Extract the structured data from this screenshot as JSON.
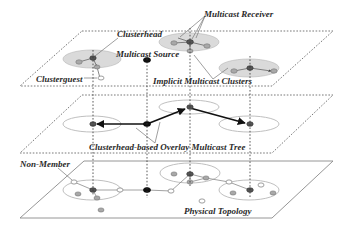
{
  "diagram": {
    "layers": [
      {
        "id": "top",
        "name": "Implicit Multicast Clusters layer"
      },
      {
        "id": "middle",
        "name": "Clusterhead-based Overlay Multicast Tree layer"
      },
      {
        "id": "bottom",
        "name": "Physical Topology layer"
      }
    ],
    "labels": {
      "clusterhead": "Clusterhead",
      "multicast_receiver": "Multicast Receiver",
      "multicast_source": "Multicast Source",
      "clusterguest": "Clusterguest",
      "implicit_multicast_clusters": "Implicit Multicast Clusters",
      "overlay_tree": "Clusterhead-based Overlay Multicast Tree",
      "non_member": "Non-Member",
      "physical_topology": "Physical Topology"
    },
    "legend_node_types": [
      {
        "type": "clusterhead",
        "color": "#555555"
      },
      {
        "type": "clusterguest",
        "color": "#a8a8a8"
      },
      {
        "type": "multicast-source",
        "color": "#111111"
      },
      {
        "type": "non-member",
        "color": "#ffffff"
      }
    ],
    "colors": {
      "cluster_fill": "#dadada",
      "tree_edge": "#111111",
      "plane_line": "#555555"
    }
  }
}
